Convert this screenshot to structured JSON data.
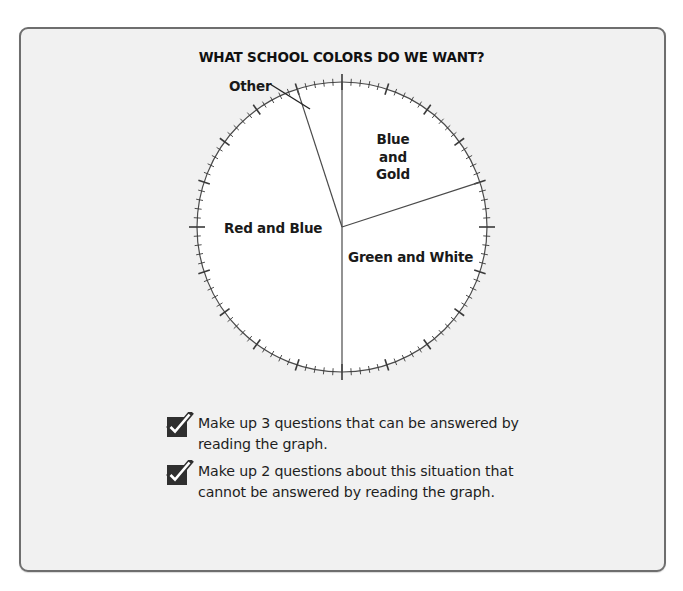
{
  "chart_data": {
    "type": "pie",
    "title": "WHAT SCHOOL COLORS DO WE WANT?",
    "categories": [
      "Blue and Gold",
      "Green and White",
      "Red and Blue",
      "Other"
    ],
    "values": [
      20,
      30,
      45,
      5
    ],
    "unit": "percent",
    "start_angle": "12 o'clock, clockwise",
    "scale": {
      "minor_ticks": 100,
      "major_every": 5,
      "quarter_marks": true
    },
    "labels": {
      "blue_gold": [
        "Blue",
        "and",
        "Gold"
      ],
      "red_blue": "Red and Blue",
      "green_white": "Green and White",
      "other": "Other"
    },
    "legend": "none (labels inside slices)"
  },
  "tasks": [
    {
      "icon": "checkbox-checked-icon",
      "text": "Make up 3 questions that can be answered by reading the graph."
    },
    {
      "icon": "checkbox-checked-icon",
      "text": "Make up 2 questions about this situation that cannot be answered by reading the graph."
    }
  ],
  "colors": {
    "panel_bg": "#f1f1f1",
    "panel_border": "#6e6e6e",
    "pie_fill": "#ffffff",
    "line": "#4a4a4a",
    "checkbox": "#2f2f2f"
  }
}
